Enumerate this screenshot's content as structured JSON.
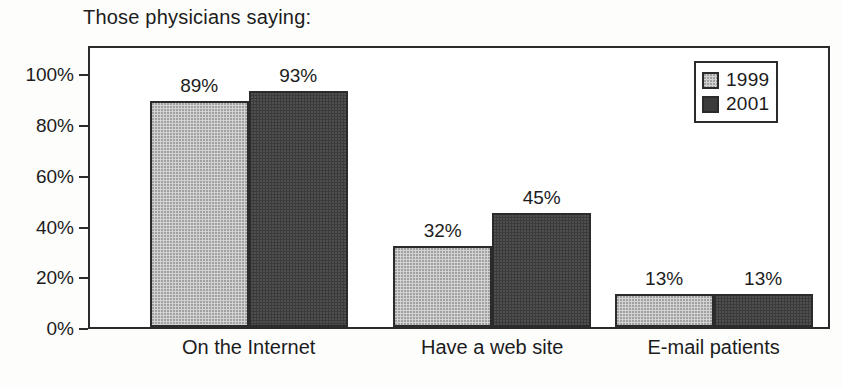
{
  "chart_data": {
    "type": "bar",
    "title": "Those physicians saying:",
    "xlabel": "",
    "ylabel": "",
    "ylim": [
      0,
      110
    ],
    "ytick_values": [
      0,
      20,
      40,
      60,
      80,
      100
    ],
    "ytick_labels": [
      "0%",
      "20%",
      "40%",
      "60%",
      "80%",
      "100%"
    ],
    "grid": false,
    "legend_position": "top-right",
    "categories": [
      "On the Internet",
      "Have a web site",
      "E-mail patients"
    ],
    "series": [
      {
        "name": "1999",
        "color": "#d2d2d2",
        "values": [
          89,
          32,
          13
        ],
        "value_labels": [
          "89%",
          "32%",
          "13%"
        ]
      },
      {
        "name": "2001",
        "color": "#3b3b3b",
        "values": [
          93,
          45,
          13
        ],
        "value_labels": [
          "93%",
          "45%",
          "13%"
        ]
      }
    ]
  },
  "legend": {
    "entries": [
      {
        "label": "1999",
        "swatch": "light-gray-swatch"
      },
      {
        "label": "2001",
        "swatch": "dark-gray-swatch"
      }
    ]
  },
  "colors": {
    "series_1999": "#d2d2d2",
    "series_2001": "#3b3b3b",
    "axis": "#2b2b2b",
    "text": "#1c1c1c",
    "background": "#ffffff"
  }
}
